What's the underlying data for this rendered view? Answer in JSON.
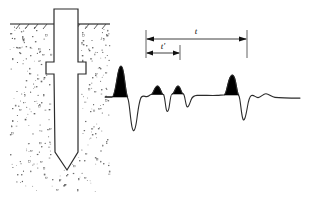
{
  "figure": {
    "background_color": "#ffffff",
    "line_color": "#1a1a1a",
    "fill_color": "#000000",
    "soil_stipple_color": "#555555"
  },
  "left_panel": {
    "name": "pile-in-soil-section",
    "ground_line": {
      "label": "ground-surface",
      "hatch_count": 8,
      "y": 24
    },
    "soil": {
      "label": "soil-stipple-region",
      "x": 10,
      "y": 24,
      "width": 100,
      "height": 168,
      "dot_count": 300
    },
    "pile": {
      "label": "pile-outline",
      "description": "driven pile with enlarged collar and pointed toe",
      "head_top_y": 9,
      "shaft_left_x": 54,
      "shaft_right_x": 78,
      "collar_left_x": 46,
      "collar_right_x": 86,
      "collar_top_y": 62,
      "collar_bottom_y": 74,
      "toe_apex_y": 170
    }
  },
  "right_panel": {
    "name": "sonic-echo-trace",
    "baseline_y": 97,
    "trace_start_x": 105,
    "trace_end_x": 300,
    "dimensions": [
      {
        "id": "t-prime",
        "label": "t′",
        "label_x": 163,
        "label_y": 48,
        "line_y": 53,
        "x_start": 146,
        "x_end": 180,
        "arrow_left": true,
        "arrow_right": true
      },
      {
        "id": "t",
        "label": "t",
        "label_x": 196,
        "label_y": 34,
        "line_y": 39,
        "x_start": 146,
        "x_end": 247,
        "arrow_left": true,
        "arrow_right": true
      }
    ],
    "peaks": [
      {
        "id": "peak-1",
        "label": "input-pulse",
        "x": 120,
        "height": 32,
        "filled": true
      },
      {
        "id": "peak-2",
        "label": "collar-reflection-1",
        "x": 158,
        "height": 12,
        "filled": true
      },
      {
        "id": "peak-3",
        "label": "collar-reflection-2",
        "x": 178,
        "height": 11,
        "filled": true
      },
      {
        "id": "peak-4",
        "label": "toe-reflection",
        "x": 232,
        "height": 23,
        "filled": true
      }
    ],
    "troughs": [
      {
        "id": "trough-1",
        "x": 131,
        "depth": 30
      },
      {
        "id": "trough-2",
        "x": 166,
        "depth": 12
      },
      {
        "id": "trough-3",
        "x": 186,
        "depth": 8
      },
      {
        "id": "trough-4",
        "x": 241,
        "depth": 20
      }
    ]
  }
}
